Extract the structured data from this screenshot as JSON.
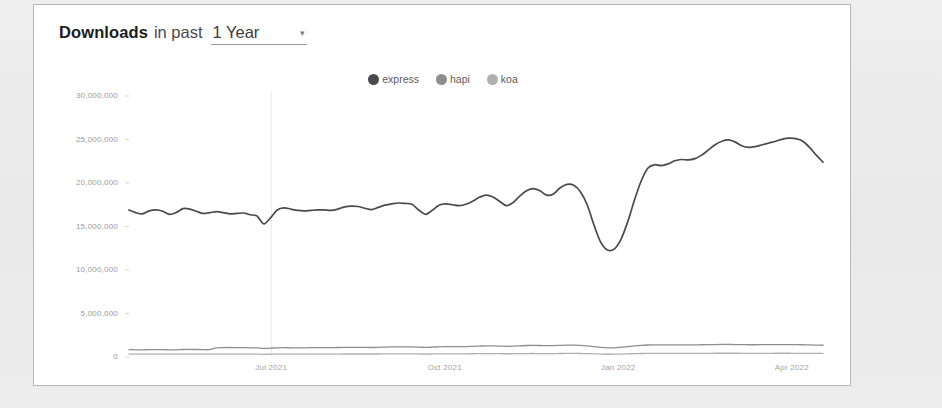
{
  "header": {
    "title_strong": "Downloads",
    "title_light": "in past",
    "range_value": "1 Year",
    "chevron": "▾"
  },
  "legend": {
    "position": "top-center",
    "items": [
      {
        "label": "express",
        "color": "#4a4a4a"
      },
      {
        "label": "hapi",
        "color": "#8e8e8e"
      },
      {
        "label": "koa",
        "color": "#b0b0b0"
      }
    ]
  },
  "chart_data": {
    "type": "line",
    "title": "Downloads in past 1 Year",
    "xlabel": "",
    "ylabel": "",
    "grid": "vertical-only",
    "ylim": [
      0,
      30000000
    ],
    "yticks": [
      0,
      5000000,
      10000000,
      15000000,
      20000000,
      25000000,
      30000000
    ],
    "ytick_labels": [
      "0",
      "5,000,000",
      "10,000,000",
      "15,000,000",
      "20,000,000",
      "25,000,000",
      "30,000,000"
    ],
    "xtick_labels": [
      "Jul 2021",
      "Oct 2021",
      "Jan 2022",
      "Apr 2022"
    ],
    "xtick_positions": [
      0.205,
      0.455,
      0.705,
      0.955
    ],
    "gridline_positions": [
      0.205
    ],
    "series": [
      {
        "name": "express",
        "color": "#4a4a4a",
        "values": [
          16900000,
          16600000,
          16450000,
          16800000,
          16900000,
          16750000,
          16400000,
          16600000,
          17050000,
          17000000,
          16750000,
          16500000,
          16600000,
          16700000,
          16600000,
          16450000,
          16500000,
          16550000,
          16350000,
          16200000,
          15300000,
          16000000,
          16900000,
          17150000,
          17000000,
          16850000,
          16800000,
          16850000,
          16900000,
          16900000,
          16850000,
          17000000,
          17250000,
          17350000,
          17300000,
          17100000,
          16950000,
          17200000,
          17450000,
          17600000,
          17700000,
          17650000,
          17550000,
          16900000,
          16400000,
          16850000,
          17450000,
          17600000,
          17500000,
          17400000,
          17550000,
          17900000,
          18350000,
          18600000,
          18400000,
          17900000,
          17400000,
          17750000,
          18500000,
          19100000,
          19350000,
          19100000,
          18600000,
          18750000,
          19450000,
          19850000,
          19750000,
          19000000,
          17500000,
          15200000,
          13200000,
          12300000,
          12400000,
          13500000,
          15500000,
          18000000,
          20200000,
          21700000,
          22100000,
          22000000,
          22200000,
          22550000,
          22700000,
          22650000,
          22800000,
          23200000,
          23800000,
          24400000,
          24800000,
          24950000,
          24700000,
          24250000,
          24100000,
          24200000,
          24400000,
          24600000,
          24800000,
          25050000,
          25150000,
          25100000,
          24800000,
          24100000,
          23200000,
          22400000
        ]
      },
      {
        "name": "hapi",
        "color": "#8e8e8e",
        "values": [
          850000,
          830000,
          820000,
          840000,
          850000,
          840000,
          820000,
          830000,
          860000,
          870000,
          860000,
          850000,
          850000,
          1050000,
          1080000,
          1090000,
          1080000,
          1070000,
          1060000,
          1040000,
          980000,
          1020000,
          1060000,
          1070000,
          1060000,
          1050000,
          1060000,
          1070000,
          1080000,
          1080000,
          1070000,
          1090000,
          1100000,
          1110000,
          1110000,
          1100000,
          1090000,
          1110000,
          1140000,
          1160000,
          1170000,
          1170000,
          1160000,
          1130000,
          1100000,
          1130000,
          1170000,
          1190000,
          1190000,
          1190000,
          1200000,
          1230000,
          1260000,
          1280000,
          1270000,
          1250000,
          1230000,
          1250000,
          1290000,
          1320000,
          1330000,
          1320000,
          1300000,
          1310000,
          1340000,
          1360000,
          1360000,
          1330000,
          1280000,
          1200000,
          1100000,
          1050000,
          1060000,
          1120000,
          1200000,
          1280000,
          1340000,
          1380000,
          1390000,
          1390000,
          1390000,
          1400000,
          1400000,
          1400000,
          1400000,
          1410000,
          1420000,
          1430000,
          1440000,
          1440000,
          1430000,
          1420000,
          1410000,
          1410000,
          1420000,
          1420000,
          1430000,
          1430000,
          1430000,
          1420000,
          1410000,
          1390000,
          1370000,
          1350000
        ]
      },
      {
        "name": "koa",
        "color": "#b0b0b0",
        "values": [
          330000,
          325000,
          320000,
          328000,
          332000,
          330000,
          322000,
          326000,
          336000,
          340000,
          336000,
          332000,
          332000,
          334000,
          336000,
          338000,
          336000,
          334000,
          332000,
          328000,
          310000,
          322000,
          334000,
          338000,
          334000,
          332000,
          334000,
          336000,
          338000,
          338000,
          336000,
          340000,
          344000,
          346000,
          346000,
          344000,
          342000,
          346000,
          352000,
          356000,
          358000,
          358000,
          356000,
          348000,
          340000,
          348000,
          358000,
          362000,
          362000,
          362000,
          364000,
          372000,
          380000,
          386000,
          384000,
          378000,
          372000,
          378000,
          388000,
          396000,
          400000,
          396000,
          392000,
          394000,
          402000,
          408000,
          408000,
          400000,
          386000,
          362000,
          332000,
          318000,
          320000,
          338000,
          362000,
          386000,
          404000,
          414000,
          418000,
          418000,
          418000,
          420000,
          420000,
          420000,
          420000,
          424000,
          426000,
          430000,
          432000,
          432000,
          430000,
          426000,
          424000,
          424000,
          426000,
          426000,
          430000,
          430000,
          430000,
          426000,
          424000,
          418000,
          412000,
          406000
        ]
      }
    ]
  },
  "colors": {
    "page_background": "#ececec",
    "card_background": "#ffffff",
    "card_border": "#b8b8b8",
    "gridline": "#e8e8e8",
    "axis_text": "#9b9b9b"
  }
}
